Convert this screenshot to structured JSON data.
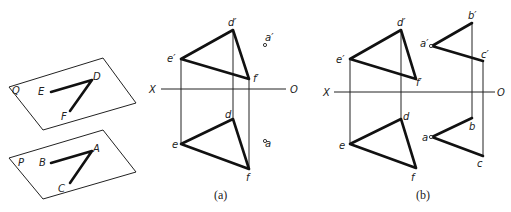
{
  "figure": {
    "planes": [
      {
        "name": "Q",
        "points": {
          "E": "E",
          "D": "D",
          "F": "F"
        }
      },
      {
        "name": "P",
        "points": {
          "B": "B",
          "A": "A",
          "C": "C"
        }
      }
    ],
    "axis": {
      "x_label": "X",
      "o_label": "O"
    },
    "panel_a": {
      "caption": "(a)",
      "labels": {
        "d_prime": "d′",
        "e_prime": "e′",
        "f_prime": "f′",
        "a_prime": "a′",
        "d": "d",
        "e": "e",
        "f": "f",
        "a": "a"
      }
    },
    "panel_b": {
      "caption": "(b)",
      "labels": {
        "d_prime": "d′",
        "e_prime": "e′",
        "f_prime": "f′",
        "a_prime": "a′",
        "b_prime": "b′",
        "c_prime": "c′",
        "d": "d",
        "e": "e",
        "f": "f",
        "a": "a",
        "b": "b",
        "c": "c"
      }
    }
  }
}
